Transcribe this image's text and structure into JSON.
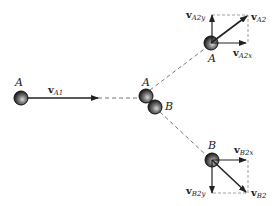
{
  "diagram": {
    "type": "oblique collision vector diagram",
    "colors": {
      "line": "#222222",
      "dashed": "#777777",
      "ball_fill": "#333333",
      "ball_highlight": "#bbbbbb"
    },
    "balls": {
      "A_initial": {
        "label": "A"
      },
      "A_collision": {
        "label": "A"
      },
      "B_collision": {
        "label": "B"
      },
      "A_final": {
        "label": "A"
      },
      "B_final": {
        "label": "B"
      }
    },
    "vectors": {
      "vA1": {
        "bold": "v",
        "sub": "A1"
      },
      "vA2": {
        "bold": "v",
        "sub": "A2"
      },
      "vA2x": {
        "bold": "v",
        "sub": "A2x"
      },
      "vA2y": {
        "bold": "v",
        "sub": "A2y"
      },
      "vB2": {
        "bold": "v",
        "sub": "B2"
      },
      "vB2x": {
        "bold": "v",
        "sub": "B2x"
      },
      "vB2y": {
        "bold": "v",
        "sub": "B2y"
      }
    }
  }
}
